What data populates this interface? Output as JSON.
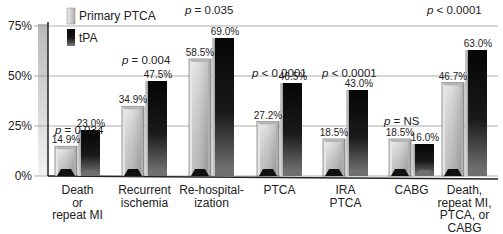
{
  "chart_data": {
    "type": "bar",
    "title": "",
    "xlabel": "",
    "ylabel": "",
    "ylim": [
      0,
      75
    ],
    "yticks": [
      "0%",
      "25%",
      "50%",
      "75%"
    ],
    "ytick_values": [
      0,
      25,
      50,
      75
    ],
    "grid": true,
    "legend_position": "top-left",
    "categories": [
      [
        "Death",
        "or",
        "repeat MI"
      ],
      [
        "Recurrent",
        "ischemia"
      ],
      [
        "Re-hospital-",
        "ization"
      ],
      [
        "PTCA"
      ],
      [
        "IRA",
        "PTCA"
      ],
      [
        "CABG"
      ],
      [
        "Death,",
        "repeat MI,",
        "PTCA, or",
        "CABG"
      ]
    ],
    "series": [
      {
        "name": "Primary PTCA",
        "values": [
          14.9,
          34.9,
          58.5,
          27.2,
          18.5,
          18.5,
          46.7
        ]
      },
      {
        "name": "tPA",
        "values": [
          23.0,
          47.5,
          69.0,
          46.5,
          43.0,
          16.0,
          63.0
        ]
      }
    ],
    "value_labels": [
      [
        "14.9%",
        "23.0%"
      ],
      [
        "34.9%",
        "47.5%"
      ],
      [
        "58.5%",
        "69.0%"
      ],
      [
        "27.2%",
        "46.5%"
      ],
      [
        "18.5%",
        "43.0%"
      ],
      [
        "18.5%",
        "16.0%"
      ],
      [
        "46.7%",
        "63.0%"
      ]
    ],
    "p_values": [
      {
        "label": "p",
        "rest": " = 0.034"
      },
      {
        "label": "p",
        "rest": " = 0.004"
      },
      {
        "label": "p",
        "rest": " = 0.035"
      },
      {
        "label": "p",
        "rest": " < 0.0001"
      },
      {
        "label": "p",
        "rest": " < 0.0001"
      },
      {
        "label": "p",
        "rest": " = NS"
      },
      {
        "label": "p",
        "rest": " < 0.0001"
      }
    ],
    "colors": {
      "primary_ptca": "#c8c8c8",
      "tpa": "#111111",
      "grid": "#9a9a9a",
      "axis": "#222222"
    }
  }
}
